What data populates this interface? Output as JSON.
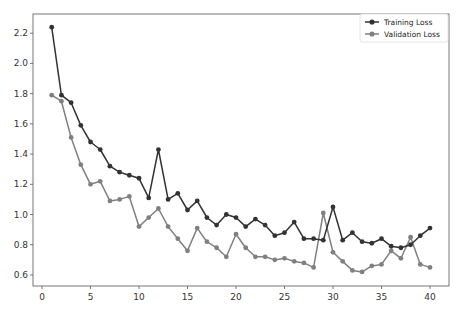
{
  "chart_data": {
    "type": "line",
    "title": "",
    "xlabel": "",
    "ylabel": "",
    "xlim": [
      -0.93,
      41.96
    ],
    "ylim": [
      0.527,
      2.327
    ],
    "grid": false,
    "legend_position": "upper right",
    "x_ticks": [
      0,
      5,
      10,
      15,
      20,
      25,
      30,
      35,
      40
    ],
    "y_ticks": [
      0.6,
      0.8,
      1.0,
      1.2,
      1.4,
      1.6,
      1.8,
      2.0,
      2.2
    ],
    "x": [
      1,
      2,
      3,
      4,
      5,
      6,
      7,
      8,
      9,
      10,
      11,
      12,
      13,
      14,
      15,
      16,
      17,
      18,
      19,
      20,
      21,
      22,
      23,
      24,
      25,
      26,
      27,
      28,
      29,
      30,
      31,
      32,
      33,
      34,
      35,
      36,
      37,
      38,
      39,
      40
    ],
    "series": [
      {
        "name": "Training Loss",
        "color": "#333333",
        "values": [
          2.24,
          1.79,
          1.74,
          1.59,
          1.48,
          1.43,
          1.32,
          1.28,
          1.26,
          1.24,
          1.11,
          1.43,
          1.1,
          1.14,
          1.03,
          1.09,
          0.98,
          0.93,
          1.0,
          0.98,
          0.92,
          0.97,
          0.93,
          0.86,
          0.88,
          0.95,
          0.84,
          0.84,
          0.83,
          1.05,
          0.83,
          0.88,
          0.82,
          0.81,
          0.84,
          0.79,
          0.78,
          0.8,
          0.86,
          0.91
        ]
      },
      {
        "name": "Validation Loss",
        "color": "#808080",
        "values": [
          1.79,
          1.75,
          1.51,
          1.33,
          1.2,
          1.22,
          1.09,
          1.1,
          1.12,
          0.92,
          0.98,
          1.04,
          0.92,
          0.84,
          0.76,
          0.91,
          0.82,
          0.78,
          0.72,
          0.87,
          0.78,
          0.72,
          0.72,
          0.7,
          0.71,
          0.69,
          0.68,
          0.65,
          1.01,
          0.75,
          0.69,
          0.63,
          0.62,
          0.66,
          0.67,
          0.76,
          0.71,
          0.85,
          0.67,
          0.65
        ]
      }
    ]
  },
  "legend": {
    "items": [
      {
        "label": "Training Loss",
        "color": "#333333"
      },
      {
        "label": "Validation Loss",
        "color": "#808080"
      }
    ]
  }
}
